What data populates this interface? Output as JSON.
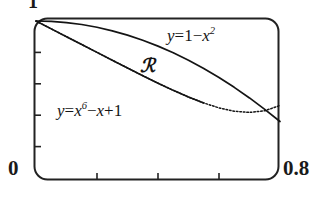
{
  "figure": {
    "kind": "graphing-calculator-viewport",
    "frame_color": "#222222",
    "curve_color": "#141414",
    "background": "#ffffff"
  },
  "axes": {
    "y_max_label": "1",
    "x_min_label": "0",
    "x_max_label": "0.8",
    "x_ticks_count": 3,
    "y_ticks_count": 4
  },
  "annotations": {
    "upper_curve_label_lhs": "y",
    "upper_curve_label_eq": "=",
    "upper_curve_label_one": "1",
    "upper_curve_label_minus": "−",
    "upper_curve_label_x": "x",
    "upper_curve_label_exp": "2",
    "lower_curve_label_lhs": "y",
    "lower_curve_label_eq": "=",
    "lower_curve_label_x1": "x",
    "lower_curve_label_exp1": "6",
    "lower_curve_label_minus": "−",
    "lower_curve_label_x2": "x",
    "lower_curve_label_plus": "+",
    "lower_curve_label_one": "1",
    "region_label": "ℛ"
  },
  "chart_data": {
    "type": "line",
    "title": "",
    "xlabel": "",
    "ylabel": "",
    "xlim": [
      0,
      0.8
    ],
    "ylim": [
      0,
      1
    ],
    "grid": false,
    "legend": "inline-annotations",
    "x_tick_values": [
      0.2,
      0.4,
      0.6
    ],
    "y_tick_values": [
      0.2,
      0.4,
      0.6,
      0.8
    ],
    "x": [
      0,
      0.05,
      0.1,
      0.15,
      0.2,
      0.25,
      0.3,
      0.35,
      0.4,
      0.45,
      0.5,
      0.55,
      0.6,
      0.65,
      0.7,
      0.75,
      0.8
    ],
    "series": [
      {
        "name": "y = 1 - x^2",
        "style": "solid",
        "values": [
          1,
          0.9975,
          0.99,
          0.9775,
          0.96,
          0.9375,
          0.91,
          0.8775,
          0.84,
          0.7975,
          0.75,
          0.6975,
          0.64,
          0.5775,
          0.51,
          0.4375,
          0.36
        ]
      },
      {
        "name": "y = x^6 - x + 1",
        "style": "dotted",
        "values": [
          1,
          0.95,
          0.9,
          0.85,
          0.8001,
          0.7502,
          0.7007,
          0.6518,
          0.6041,
          0.5583,
          0.5156,
          0.4778,
          0.4467,
          0.4254,
          0.4176,
          0.428,
          0.4621
        ]
      }
    ],
    "shaded_region": {
      "label": "ℛ",
      "between": [
        "y = 1 - x^2",
        "y = x^6 - x + 1"
      ],
      "x_from": 0,
      "x_to": 0.72
    }
  }
}
